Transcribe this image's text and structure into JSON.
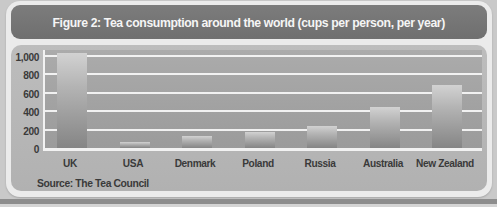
{
  "figure": {
    "title": "Figure 2: Tea consumption around the world (cups per person, per year)",
    "source": "Source: The Tea Council"
  },
  "chart_data": {
    "type": "bar",
    "title": "Figure 2: Tea consumption around the world (cups per person, per year)",
    "categories": [
      "UK",
      "USA",
      "Denmark",
      "Poland",
      "Russia",
      "Australia",
      "New Zealand"
    ],
    "values": [
      1030,
      65,
      130,
      170,
      240,
      450,
      680
    ],
    "xlabel": "",
    "ylabel": "cups per person, per year",
    "ylim": [
      0,
      1000
    ],
    "yticks": [
      0,
      200,
      400,
      600,
      800,
      1000
    ],
    "ytick_labels": [
      "0",
      "200",
      "400",
      "600",
      "800",
      "1,000"
    ],
    "grid": true,
    "legend": false,
    "source": "Source: The Tea Council"
  },
  "colors": {
    "page_background": "#c9c9c9",
    "frame_background": "#ebebeb",
    "title_bar": "#757575",
    "title_text": "#f5f5f5",
    "panel_background": "#b7b7b7",
    "plot_background": "#a3a3a3",
    "gridline": "#f2f2f2",
    "bar_top": "#d2d2d2",
    "bar_bottom": "#858585",
    "label_text": "#3a3a3a",
    "bottom_strip": "#8d8d8d"
  }
}
